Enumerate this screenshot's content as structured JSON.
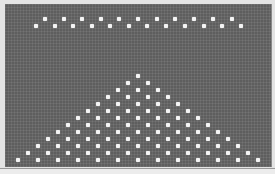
{
  "display": {
    "background_color": "#5e5e5e",
    "dot_color": "#f4f4f4",
    "frame_color": "#e4e4e4"
  },
  "top_pattern": {
    "rows": [
      {
        "y": 19,
        "x": [
          45,
          64,
          82,
          101,
          119,
          138,
          157,
          175,
          194,
          213,
          232
        ]
      },
      {
        "y": 26,
        "x": [
          36,
          55,
          73,
          92,
          110,
          129,
          147,
          166,
          185,
          204,
          222,
          241
        ]
      }
    ]
  },
  "pyramid_pattern": {
    "apex_x": 138,
    "apex_y": 76,
    "row_count": 13,
    "row_height": 7,
    "dot_spacing": 20
  }
}
